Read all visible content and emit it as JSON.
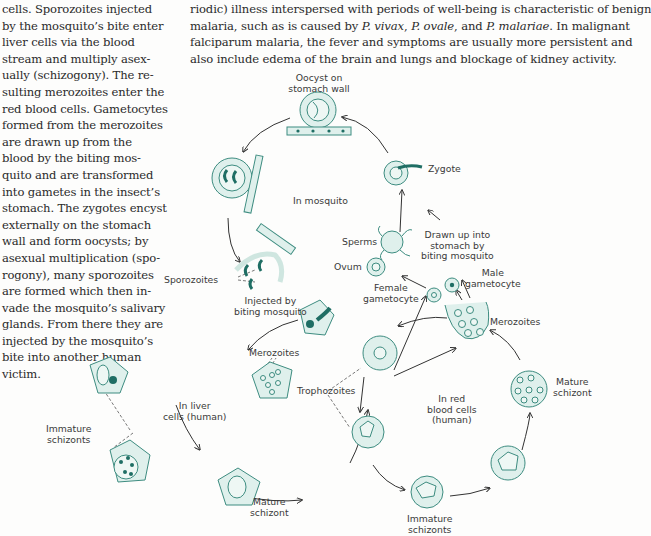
{
  "left_column": {
    "lines": [
      "cells. Sporozoites injected",
      "by the mosquito’s bite enter",
      "liver cells via the blood",
      "stream and multiply asex-",
      "ually (schizogony). The re-",
      "sulting merozoites enter the",
      "red blood cells. Gametocytes",
      "formed from the merozoites",
      "are drawn up from the",
      "blood by the biting mos-",
      "quito and are transformed",
      "into gametes in the insect’s",
      "stomach. The zygotes encyst",
      "externally on the stomach",
      "wall and form oocysts; by",
      "asexual multiplication (spo-",
      "rogony), many sporozoites",
      "are formed which then in-",
      "vade the mosquito’s salivary",
      "glands. From there they are",
      "injected by the mosquito’s",
      "bite into another human",
      "victim."
    ]
  },
  "top_text": {
    "line1": "riodic) illness interspersed with periods of well-being is characteristic of benign",
    "line2_a": "malaria, such as is caused by ",
    "line2_vivax": "P. vivax",
    "line2_b": ", ",
    "line2_ovale": "P. ovale",
    "line2_c": ", and ",
    "line2_malariae": "P. malariae",
    "line2_d": ". In malignant",
    "line3": "falciparum malaria, the fever and symptoms are usually more persistent and",
    "line4": "also include edema of the brain and lungs and blockage of kidney activity."
  },
  "figure": {
    "colors": {
      "cell_fill": "#dff0ec",
      "cell_stroke": "#3d8c80",
      "parasite": "#1f6e64",
      "line": "#333333"
    },
    "labels": {
      "oocyst_1": "Oocyst on",
      "oocyst_2": "stomach wall",
      "zygote": "Zygote",
      "in_mosquito": "In mosquito",
      "sperms": "Sperms",
      "drawn_1": "Drawn up into",
      "drawn_2": "stomach by",
      "drawn_3": "biting mosquito",
      "ovum": "Ovum",
      "male_1": "Male",
      "male_2": "gametocyte",
      "female_1": "Female",
      "female_2": "gametocyte",
      "sporozoites": "Sporozoites",
      "injected_1": "Injected by",
      "injected_2": "biting mosquito",
      "merozoites_rbc": "Merozoites",
      "merozoites_liver": "Merozoites",
      "in_liver_1": "In liver",
      "in_liver_2": "cells (human)",
      "immature_liver_1": "Immature",
      "immature_liver_2": "schizonts",
      "mature_liver_1": "Mature",
      "mature_liver_2": "schizont",
      "trophozoites": "Trophozoites",
      "in_red_1": "In red",
      "in_red_2": "blood cells",
      "in_red_3": "(human)",
      "mature_rbc_1": "Mature",
      "mature_rbc_2": "schizont",
      "immature_rbc_1": "Immature",
      "immature_rbc_2": "schizonts"
    }
  }
}
